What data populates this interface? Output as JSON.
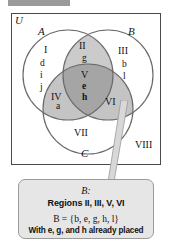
{
  "universe": {
    "label": "U"
  },
  "sets": {
    "a_label": "A",
    "b_label": "B",
    "c_label": "C"
  },
  "regions": [
    {
      "id": "I",
      "label": "I",
      "shaded": false
    },
    {
      "id": "II",
      "label": "II",
      "shaded": true
    },
    {
      "id": "III",
      "label": "III",
      "shaded": false
    },
    {
      "id": "IV",
      "label": "IV",
      "shaded": true
    },
    {
      "id": "V",
      "label": "V",
      "shaded": true
    },
    {
      "id": "VI",
      "label": "VI",
      "shaded": true
    },
    {
      "id": "VII",
      "label": "VII",
      "shaded": false
    },
    {
      "id": "VIII",
      "label": "VIII",
      "shaded": false
    }
  ],
  "elements": {
    "region_I": [
      "d",
      "i",
      "j"
    ],
    "region_II": [
      "g"
    ],
    "region_III": [
      "b",
      "l"
    ],
    "region_IV": [
      "a"
    ],
    "region_V": [
      "e",
      "h"
    ]
  },
  "caption": {
    "title": "B:",
    "regions_line": "Regions II, III, V, VI",
    "set_line": "B = {b, e, g, h, l}",
    "note_line": "With e, g, and h already placed"
  },
  "colors": {
    "shade_light": "#cccccc",
    "shade_mid": "#bdbdbd",
    "shade_dark": "#a8a8a8",
    "outline": "#6b6b6b",
    "box_border": "#4a4a4a",
    "callout_bg": "#e6e6e6",
    "callout_border": "#9b9b9b"
  }
}
